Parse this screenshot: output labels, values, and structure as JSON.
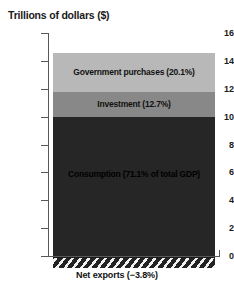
{
  "chart_data": {
    "type": "bar",
    "title": "Trillions of dollars ($)",
    "xlabel": "",
    "ylabel": "Trillions of dollars ($)",
    "ylim": [
      0,
      16
    ],
    "yticks": [
      0,
      2,
      4,
      6,
      8,
      10,
      12,
      14,
      16
    ],
    "ytick_labels": [
      "0",
      "2",
      "4",
      "6",
      "8",
      "10",
      "12",
      "14",
      "16"
    ],
    "grid": false,
    "legend": "none",
    "stacked": true,
    "categories": [
      "Total GDP"
    ],
    "series": [
      {
        "name": "Consumption",
        "label": "Consumption (71.1% of total GDP)",
        "percent": 71.1,
        "values": [
          10.0
        ],
        "range": [
          0.0,
          10.0
        ],
        "color": "#262626"
      },
      {
        "name": "Investment",
        "label": "Investment (12.7%)",
        "percent": 12.7,
        "values": [
          1.8
        ],
        "range": [
          10.0,
          11.8
        ],
        "color": "#888888"
      },
      {
        "name": "Government purchases",
        "label": "Government purchases (20.1%)",
        "percent": 20.1,
        "values": [
          2.8
        ],
        "range": [
          11.8,
          14.6
        ],
        "color": "#b8b8b8"
      },
      {
        "name": "Net exports",
        "label": "Net exports (−3.8%)",
        "percent": -3.8,
        "values": [
          -0.54
        ],
        "range": [
          -0.54,
          0.0
        ],
        "color": "hatched"
      }
    ],
    "annotations": [
      "Government purchases (20.1%)",
      "Investment (12.7%)",
      "Consumption (71.1% of total GDP)",
      "Net exports (−3.8%)"
    ]
  },
  "axis": {
    "title": "Trillions of dollars ($)",
    "ticks": [
      {
        "value": 16,
        "label": "16"
      },
      {
        "value": 14,
        "label": "14"
      },
      {
        "value": 12,
        "label": "12"
      },
      {
        "value": 10,
        "label": "10"
      },
      {
        "value": 8,
        "label": "8"
      },
      {
        "value": 6,
        "label": "6"
      },
      {
        "value": 4,
        "label": "4"
      },
      {
        "value": 2,
        "label": "2"
      },
      {
        "value": 0,
        "label": "0"
      }
    ]
  },
  "segments": {
    "government": "Government purchases (20.1%)",
    "investment": "Investment (12.7%)",
    "consumption": "Consumption (71.1% of total GDP)",
    "net_exports": "Net exports (−3.8%)"
  },
  "colors": {
    "government": "#b8b8b8",
    "investment": "#888888",
    "consumption": "#262626",
    "axis": "#58585a",
    "text": "#1a1a1a",
    "background": "#ffffff"
  }
}
